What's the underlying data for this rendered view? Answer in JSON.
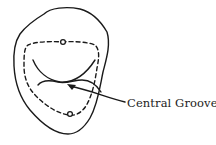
{
  "figure": {
    "type": "tooth occlusal outline diagram",
    "colors": {
      "stroke": "#1a1a1a",
      "background": "#ffffff"
    },
    "label": "Central Groove"
  }
}
